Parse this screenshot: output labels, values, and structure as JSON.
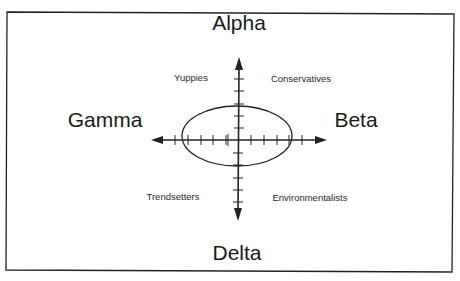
{
  "diagram": {
    "type": "perceptual-map",
    "poles": {
      "top": "Alpha",
      "bottom": "Delta",
      "left": "Gamma",
      "right": "Beta"
    },
    "quadrants": {
      "top_left": "Yuppies",
      "top_right": "Conservatives",
      "bottom_left": "Trendsetters",
      "bottom_right": "Environmentalists"
    },
    "colors": {
      "ink": "#222222",
      "background": "#ffffff"
    }
  }
}
